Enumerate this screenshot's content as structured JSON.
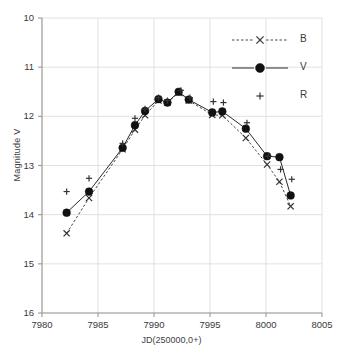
{
  "chart_data": {
    "type": "scatter",
    "title": "",
    "xlabel": "JD(250000,0+)",
    "ylabel": "Magnitude V",
    "xlim": [
      7980,
      8005
    ],
    "ylim": [
      16,
      10
    ],
    "y_inverted": true,
    "grid": true,
    "xticks": [
      7980,
      7985,
      7990,
      7995,
      8000,
      8005
    ],
    "yticks": [
      10,
      11,
      12,
      13,
      14,
      15,
      16
    ],
    "legend_position": "top-right",
    "series": [
      {
        "name": "B",
        "marker": "x",
        "line": "dashed",
        "color": "#333333",
        "points": [
          [
            7982.2,
            14.38
          ],
          [
            7984.2,
            13.66
          ],
          [
            7987.2,
            12.67
          ],
          [
            7988.3,
            12.27
          ],
          [
            7989.2,
            11.98
          ],
          [
            7990.4,
            11.68
          ],
          [
            7991.2,
            11.72
          ],
          [
            7992.2,
            11.52
          ],
          [
            7993.1,
            11.68
          ],
          [
            7995.2,
            11.97
          ],
          [
            7996.1,
            11.98
          ],
          [
            7998.2,
            12.44
          ],
          [
            8000.1,
            12.98
          ],
          [
            8001.2,
            13.33
          ],
          [
            8002.2,
            13.83
          ]
        ]
      },
      {
        "name": "V",
        "marker": "filled-circle",
        "line": "solid",
        "color": "#111111",
        "points": [
          [
            7982.2,
            13.96
          ],
          [
            7984.2,
            13.53
          ],
          [
            7987.2,
            12.64
          ],
          [
            7988.3,
            12.18
          ],
          [
            7989.2,
            11.89
          ],
          [
            7990.4,
            11.65
          ],
          [
            7991.2,
            11.72
          ],
          [
            7992.2,
            11.5
          ],
          [
            7993.1,
            11.66
          ],
          [
            7995.2,
            11.92
          ],
          [
            7996.1,
            11.9
          ],
          [
            7998.2,
            12.25
          ],
          [
            8000.1,
            12.81
          ],
          [
            8001.2,
            12.83
          ],
          [
            8002.2,
            13.61
          ]
        ]
      },
      {
        "name": "R",
        "marker": "plus",
        "line": "none",
        "color": "#333333",
        "points": [
          [
            7982.2,
            13.53
          ],
          [
            7984.2,
            13.26
          ],
          [
            7987.2,
            12.55
          ],
          [
            7988.3,
            12.04
          ],
          [
            7989.2,
            11.85
          ],
          [
            7990.4,
            11.62
          ],
          [
            7991.2,
            11.68
          ],
          [
            7992.4,
            11.47
          ],
          [
            7993.2,
            11.62
          ],
          [
            7995.3,
            11.7
          ],
          [
            7996.2,
            11.72
          ],
          [
            7998.3,
            12.13
          ],
          [
            8000.2,
            12.81
          ],
          [
            8001.3,
            13.08
          ],
          [
            8002.3,
            13.28
          ]
        ]
      }
    ]
  },
  "legend": {
    "items": [
      {
        "label": "B"
      },
      {
        "label": "V"
      },
      {
        "label": "R"
      }
    ]
  },
  "axes": {
    "y_title": "Magnitude V",
    "x_title": "JD(250000,0+)",
    "y_tick_labels": [
      "10",
      "11",
      "12",
      "13",
      "14",
      "15",
      "16"
    ],
    "x_tick_labels": [
      "7980",
      "7985",
      "7990",
      "7995",
      "8000",
      "8005"
    ]
  },
  "colors": {
    "axis": "#9a9a9a",
    "grid": "#d9d9d9",
    "text": "#3a3a3a",
    "marker": "#1a1a1a"
  }
}
